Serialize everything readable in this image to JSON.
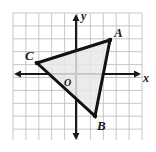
{
  "figure": {
    "kind": "coordinate-plane-triangle",
    "width": 156,
    "height": 152,
    "background_color": "#ffffff"
  },
  "grid": {
    "line_color": "#b9b9b9",
    "line_width": 0.8,
    "cell_size": 12.9,
    "left": 13,
    "top": 13,
    "right": 142,
    "bottom": 140,
    "columns": 10,
    "rows": 10,
    "visible": true
  },
  "axes": {
    "color": "#1a1a1a",
    "line_width": 2,
    "origin_px": {
      "x": 76,
      "y": 74
    },
    "x_axis": {
      "label": "x",
      "label_px": {
        "x": 143,
        "y": 72
      },
      "start_px": {
        "x": 15,
        "y": 74
      },
      "end_px": {
        "x": 140,
        "y": 74
      },
      "arrow_left": true,
      "arrow_right": true
    },
    "y_axis": {
      "label": "y",
      "label_px": {
        "x": 81,
        "y": 10
      },
      "start_px": {
        "x": 76,
        "y": 15
      },
      "end_px": {
        "x": 76,
        "y": 139
      },
      "arrow_up": true,
      "arrow_down": true
    },
    "origin_label": "O",
    "origin_label_px": {
      "x": 64,
      "y": 78
    }
  },
  "triangle": {
    "name": "triangle-ABC",
    "fill_color": "#e8e8ea",
    "fill_opacity": 0.85,
    "stroke_color": "#111111",
    "stroke_width": 3,
    "vertices": [
      {
        "label": "A",
        "px": {
          "x": 110,
          "y": 40
        },
        "grid": {
          "x": 2.6,
          "y": 2.6
        },
        "label_px": {
          "x": 114,
          "y": 26
        }
      },
      {
        "label": "B",
        "px": {
          "x": 95,
          "y": 116
        },
        "grid": {
          "x": 1.5,
          "y": -3.3
        },
        "label_px": {
          "x": 97,
          "y": 119
        }
      },
      {
        "label": "C",
        "px": {
          "x": 37,
          "y": 63
        },
        "grid": {
          "x": -3.0,
          "y": 0.85
        },
        "label_px": {
          "x": 25,
          "y": 49
        }
      }
    ]
  },
  "chart_data": {
    "type": "scatter",
    "title": "",
    "xlabel": "x",
    "ylabel": "y",
    "xlim": [
      -5,
      5
    ],
    "ylim": [
      -5,
      5
    ],
    "grid": true,
    "legend": "none",
    "annotations": [
      "A",
      "B",
      "C",
      "O"
    ],
    "series": [
      {
        "name": "triangle ABC",
        "points": [
          {
            "label": "A",
            "x": 2.6,
            "y": 2.6
          },
          {
            "label": "B",
            "x": 1.5,
            "y": -3.3
          },
          {
            "label": "C",
            "x": -3.0,
            "y": 0.85
          }
        ],
        "closed": true,
        "fill": "#e8e8ea",
        "stroke": "#111111"
      }
    ]
  }
}
